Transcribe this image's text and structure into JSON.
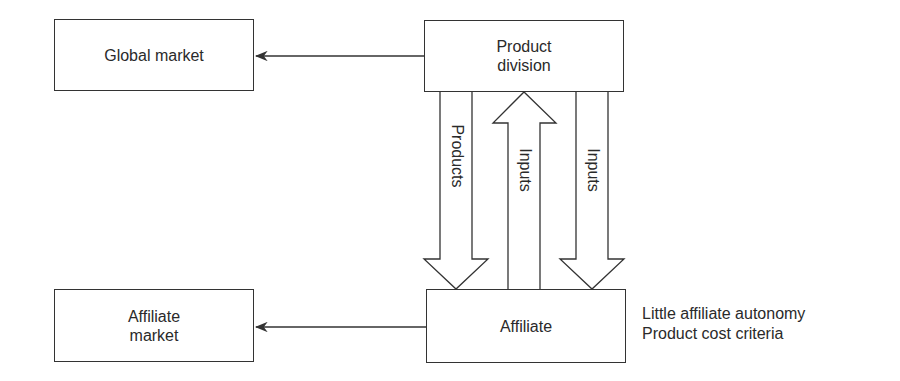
{
  "diagram": {
    "nodes": {
      "global_market": {
        "label": "Global market"
      },
      "product_division": {
        "label_line1": "Product",
        "label_line2": "division"
      },
      "affiliate_market": {
        "label_line1": "Affiliate",
        "label_line2": "market"
      },
      "affiliate": {
        "label": "Affiliate"
      }
    },
    "flows": {
      "products": {
        "label": "Products",
        "direction": "down"
      },
      "inputs_up": {
        "label": "Inputs",
        "direction": "up"
      },
      "inputs_down": {
        "label": "Inputs",
        "direction": "down"
      }
    },
    "notes": {
      "line1": "Little affiliate autonomy",
      "line2": "Product cost criteria"
    },
    "colors": {
      "stroke": "#333333",
      "text": "#2a2a2a",
      "background": "#ffffff"
    }
  }
}
